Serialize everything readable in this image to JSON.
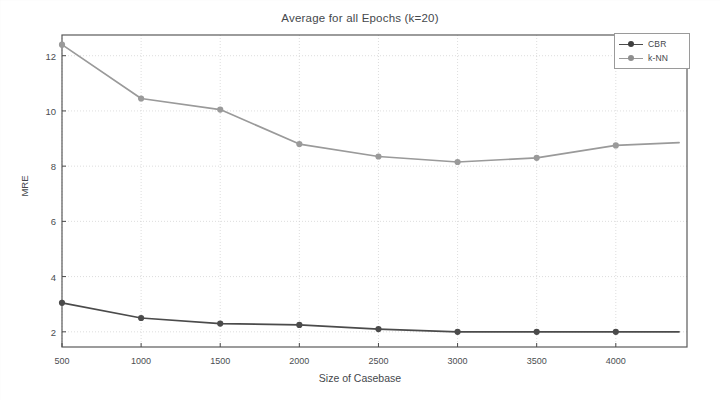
{
  "chart_data": {
    "type": "line",
    "title": "Average for all Epochs (k=20)",
    "xlabel": "Size of Casebase",
    "ylabel": "MRE",
    "xlim": [
      500,
      4450
    ],
    "ylim": [
      1.45,
      12.75
    ],
    "grid": true,
    "legend_position": "top-right",
    "x": [
      500,
      1000,
      1500,
      2000,
      2500,
      3000,
      3500,
      4000,
      4400
    ],
    "xticks": [
      500,
      1000,
      1500,
      2000,
      2500,
      3000,
      3500,
      4000
    ],
    "xticklabels": [
      "500",
      "1000",
      "1500",
      "2000",
      "2500",
      "3000",
      "3500",
      "4000"
    ],
    "yticks": [
      2,
      4,
      6,
      8,
      10,
      12
    ],
    "yticklabels": [
      "2",
      "4",
      "6",
      "8",
      "10",
      "12"
    ],
    "series": [
      {
        "name": "CBR",
        "color": "#4b4b4b",
        "marker": "circle",
        "values": [
          3.05,
          2.5,
          2.3,
          2.25,
          2.1,
          2.0,
          2.0,
          2.0,
          2.0
        ]
      },
      {
        "name": "k-NN",
        "color": "#9a9a9a",
        "marker": "circle",
        "values": [
          12.4,
          10.45,
          10.05,
          8.8,
          8.35,
          8.15,
          8.3,
          8.75,
          8.85
        ]
      }
    ]
  },
  "legend": {
    "entries": [
      {
        "label": "CBR"
      },
      {
        "label": "k-NN"
      }
    ]
  }
}
